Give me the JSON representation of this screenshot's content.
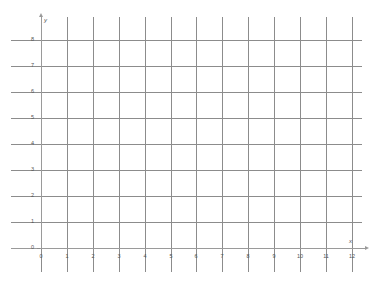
{
  "chart_data": {
    "type": "scatter",
    "title": "",
    "subtitle": "",
    "xlabel": "x",
    "ylabel": "y",
    "xlim": [
      0,
      12
    ],
    "ylim": [
      0,
      8
    ],
    "x_ticks": [
      0,
      1,
      2,
      3,
      4,
      5,
      6,
      7,
      8,
      9,
      10,
      11,
      12
    ],
    "x_tick_labels": [
      "0",
      "1",
      "2",
      "3",
      "4",
      "5",
      "6",
      "7",
      "8",
      "9",
      "10",
      "11",
      "12"
    ],
    "y_ticks": [
      0,
      1,
      2,
      3,
      4,
      5,
      6,
      7,
      8
    ],
    "y_tick_labels": [
      "0",
      "1",
      "2",
      "3",
      "4",
      "5",
      "6",
      "7",
      "8"
    ],
    "grid": true,
    "grid_color": "#8c8c8c",
    "axis_color": "#9a9a9a",
    "background": "#ffffff",
    "legend": null,
    "legend_position": "none",
    "series": [],
    "values": [],
    "annotations": []
  },
  "axes": {
    "x_axis_label": "x",
    "y_axis_label": "y",
    "origin_label": "0"
  }
}
